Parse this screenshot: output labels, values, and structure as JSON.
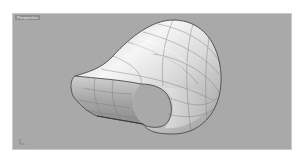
{
  "viewport": {
    "title": "Perspective",
    "background_color": "#a9a9a9",
    "border_color": "#c9c9c9"
  },
  "model": {
    "description": "lofted tube surface with elliptical opening",
    "surface_color_light": "#f4f4f4",
    "surface_color_mid": "#cfcfcf",
    "surface_color_dark": "#8a8a8a",
    "edge_color": "#4a4a4a",
    "isocurve_color": "#7a7a7a"
  },
  "axis_icon": {
    "name": "world-axes-icon"
  }
}
